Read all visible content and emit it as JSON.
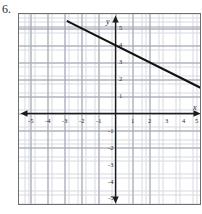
{
  "problem": {
    "number": "6."
  },
  "graph": {
    "axis_labels": {
      "x": "x",
      "y": "y"
    },
    "x_ticks": [
      "-5",
      "-4",
      "-3",
      "-2",
      "-1",
      "1",
      "2",
      "3",
      "4",
      "5"
    ],
    "y_ticks": [
      "5",
      "4",
      "3",
      "2",
      "1",
      "-1",
      "-2",
      "-3",
      "-4",
      "-5"
    ],
    "colors": {
      "minor_grid": "#c9cdd6",
      "major_grid": "#9aa0ad",
      "axis": "#1a1a1a",
      "line": "#111111",
      "frame": "#6e6e6e",
      "background": "#ffffff"
    }
  },
  "chart_data": {
    "type": "line",
    "title": "",
    "xlabel": "x",
    "ylabel": "y",
    "xlim": [
      -5,
      5
    ],
    "ylim": [
      -5,
      5
    ],
    "grid": true,
    "minor_grid_divisions": 4,
    "legend": "none",
    "series": [
      {
        "name": "line",
        "equation": "y = -0.5x + 4",
        "slope": -0.5,
        "y_intercept": 4,
        "x_intercept": 8,
        "points": [
          [
            -2.8,
            5.4
          ],
          [
            0,
            4
          ],
          [
            5,
            1.5
          ]
        ],
        "drawn_from": [
          -2.8,
          5.4
        ],
        "drawn_to": [
          5.6,
          1.2
        ]
      }
    ],
    "x_tick_values": [
      -5,
      -4,
      -3,
      -2,
      -1,
      1,
      2,
      3,
      4,
      5
    ],
    "y_tick_values": [
      5,
      4,
      3,
      2,
      1,
      -1,
      -2,
      -3,
      -4,
      -5
    ]
  }
}
